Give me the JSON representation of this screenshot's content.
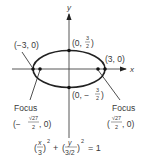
{
  "diagram": {
    "type": "ellipse",
    "axes": {
      "x_label": "x",
      "y_label": "y"
    },
    "colors": {
      "stroke": "#222222",
      "axis": "#444444",
      "text": "#3a3a3a"
    },
    "points": {
      "left_vertex": "(−3, 0)",
      "right_vertex": "(3, 0)",
      "top_covertex_prefix": "(0, ",
      "top_covertex_num": "3",
      "top_covertex_den": "2",
      "top_covertex_suffix": ")",
      "bottom_covertex_prefix": "(0, −",
      "bottom_covertex_num": "3",
      "bottom_covertex_den": "2",
      "bottom_covertex_suffix": ")"
    },
    "foci": {
      "left": {
        "label": "Focus",
        "coord_prefix": "(−",
        "num": "√27",
        "den": "2",
        "coord_suffix": ", 0)"
      },
      "right": {
        "label": "Focus",
        "coord_prefix": "(",
        "num": "√27",
        "den": "2",
        "coord_suffix": ", 0)"
      }
    },
    "equation": {
      "term1_num": "x",
      "term1_den": "3",
      "term2_num": "y",
      "term2_den": "3/2",
      "exponent": "2",
      "plus": "+",
      "equals": "= 1"
    }
  }
}
